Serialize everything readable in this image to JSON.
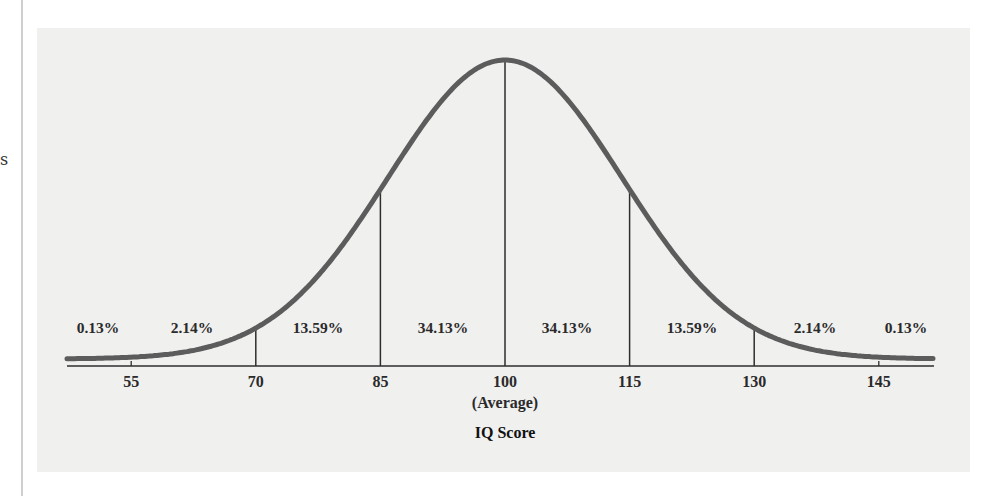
{
  "page": {
    "edge_text": "s"
  },
  "chart_data": {
    "type": "line",
    "title": "",
    "xlabel": "IQ Score",
    "ylabel": "",
    "distribution": "normal",
    "mean": 100,
    "sd": 15,
    "x_ticks": [
      55,
      70,
      85,
      100,
      115,
      130,
      145
    ],
    "x_tick_labels": [
      "55",
      "70",
      "85",
      "100",
      "115",
      "130",
      "145"
    ],
    "mean_annotation": "(Average)",
    "divider_lines_at": [
      70,
      85,
      100,
      115,
      130
    ],
    "regions": [
      {
        "range": "< 55",
        "label": "0.13%",
        "value": 0.13
      },
      {
        "range": "55-70",
        "label": "2.14%",
        "value": 2.14
      },
      {
        "range": "70-85",
        "label": "13.59%",
        "value": 13.59
      },
      {
        "range": "85-100",
        "label": "34.13%",
        "value": 34.13
      },
      {
        "range": "100-115",
        "label": "34.13%",
        "value": 34.13
      },
      {
        "range": "115-130",
        "label": "13.59%",
        "value": 13.59
      },
      {
        "range": "130-145",
        "label": "2.14%",
        "value": 2.14
      },
      {
        "range": "> 145",
        "label": "0.13%",
        "value": 0.13
      }
    ],
    "xlim": [
      40,
      160
    ],
    "grid": false,
    "legend": "none",
    "colors": {
      "curve": "#5c5c5c",
      "lines": "#2e2e2e",
      "background": "#f0f0ef"
    }
  }
}
